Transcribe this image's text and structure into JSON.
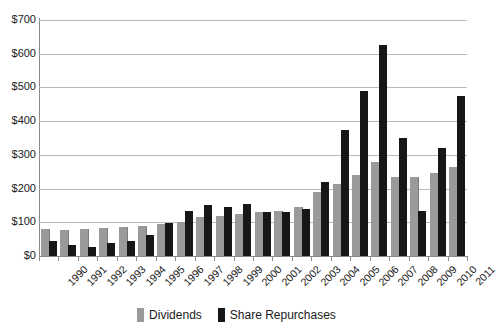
{
  "chart_data": {
    "type": "bar",
    "title": "",
    "xlabel": "",
    "ylabel": "",
    "ylim": [
      0,
      700
    ],
    "ytick_labels": [
      "$700",
      "$600",
      "$500",
      "$400",
      "$300",
      "$200",
      "$100",
      "$0"
    ],
    "ytick_values": [
      700,
      600,
      500,
      400,
      300,
      200,
      100,
      0
    ],
    "grid": true,
    "legend_position": "bottom-center",
    "categories": [
      "1990",
      "1991",
      "1992",
      "1993",
      "1994",
      "1995",
      "1996",
      "1997",
      "1998",
      "1999",
      "2000",
      "2001",
      "2002",
      "2003",
      "2004",
      "2005",
      "2006",
      "2007",
      "2008",
      "2009",
      "2010",
      "2011"
    ],
    "series": [
      {
        "name": "Dividends",
        "color": "#9a9a9a",
        "values": [
          80,
          78,
          79,
          82,
          85,
          90,
          95,
          100,
          115,
          120,
          125,
          130,
          135,
          145,
          190,
          215,
          240,
          278,
          235,
          235,
          245,
          265
        ]
      },
      {
        "name": "Share Repurchases",
        "color": "#171717",
        "values": [
          45,
          32,
          28,
          38,
          45,
          62,
          98,
          135,
          150,
          145,
          155,
          130,
          130,
          140,
          220,
          375,
          490,
          625,
          350,
          135,
          320,
          475
        ]
      }
    ]
  },
  "legend": {
    "items": [
      {
        "label": "Dividends",
        "swatch": "dividends-swatch"
      },
      {
        "label": "Share Repurchases",
        "swatch": "share-repurchases-swatch"
      }
    ]
  }
}
